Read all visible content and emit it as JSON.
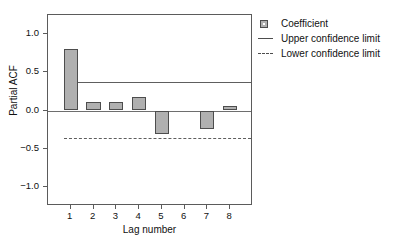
{
  "chart_data": {
    "type": "bar",
    "title": "",
    "xlabel": "Lag number",
    "ylabel": "Partial ACF",
    "categories": [
      "1",
      "2",
      "3",
      "4",
      "5",
      "6",
      "7",
      "8"
    ],
    "values": [
      0.8,
      0.11,
      0.11,
      0.18,
      -0.31,
      0.0,
      -0.24,
      0.06
    ],
    "series": [
      {
        "name": "Coefficient",
        "values": [
          0.8,
          0.11,
          0.11,
          0.18,
          -0.31,
          0.0,
          -0.24,
          0.06
        ]
      }
    ],
    "ylim": [
      -1.25,
      1.25
    ],
    "yticks": [
      1.0,
      0.5,
      0.0,
      -0.5,
      -1.0
    ],
    "ytick_labels": [
      "1.0",
      "0.5",
      "0.0",
      "-0.5",
      "-1.0"
    ],
    "xticks": [
      1,
      2,
      3,
      4,
      5,
      6,
      7,
      8
    ],
    "grid": false,
    "legend_position": "right-top",
    "reference_lines": [
      {
        "name": "Upper confidence limit",
        "value": 0.37,
        "style": "solid"
      },
      {
        "name": "Lower confidence limit",
        "value": -0.36,
        "style": "dashed"
      }
    ],
    "bar_color": "#b0b0b0",
    "bar_edge_color": "#4d4d4d",
    "line_color": "#5e5e5e"
  },
  "axes": {
    "y_title": "Partial ACF",
    "x_title": "Lag number",
    "y_tick_labels": [
      "1.0",
      "0.5",
      "0.0",
      "-0.5",
      "-1.0"
    ],
    "x_tick_labels": [
      "1",
      "2",
      "3",
      "4",
      "5",
      "6",
      "7",
      "8"
    ]
  },
  "legend": {
    "items": [
      {
        "label": "Coefficient",
        "key": "filled-square-swatch"
      },
      {
        "label": "Upper confidence limit",
        "key": "solid-line-swatch"
      },
      {
        "label": "Lower confidence limit",
        "key": "dashed-line-swatch"
      }
    ]
  },
  "title": {
    "text": ""
  }
}
